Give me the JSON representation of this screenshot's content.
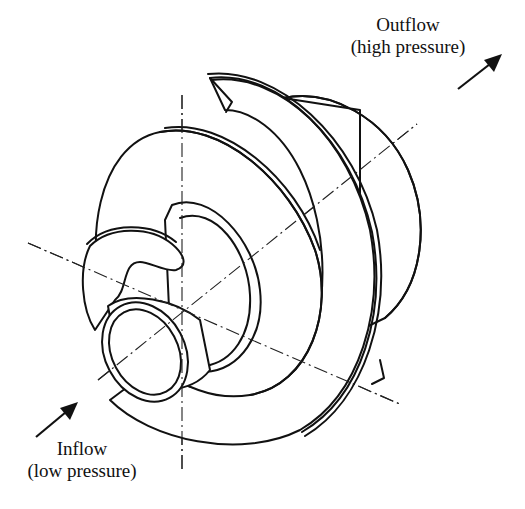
{
  "diagram": {
    "outflow": {
      "title": "Outflow",
      "subtitle": "(high pressure)",
      "arrow_icon": "arrow-up-right-icon"
    },
    "inflow": {
      "title": "Inflow",
      "subtitle": "(low pressure)",
      "arrow_icon": "arrow-up-right-icon"
    },
    "colors": {
      "line": "#111111",
      "background": "#ffffff"
    }
  }
}
